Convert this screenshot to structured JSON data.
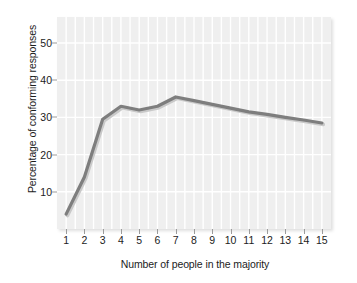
{
  "chart_data": {
    "type": "line",
    "title": "",
    "xlabel": "Number of people in the majority",
    "ylabel": "Percentage of conforming responses",
    "x": [
      1,
      2,
      3,
      4,
      5,
      6,
      7,
      8,
      9,
      10,
      11,
      12,
      13,
      14,
      15
    ],
    "values": [
      4,
      14,
      29.5,
      33,
      32,
      33,
      35.5,
      34.5,
      33.5,
      32.5,
      31.5,
      30.8,
      30,
      29.3,
      28.5
    ],
    "series": [
      {
        "name": "Conforming responses",
        "values": [
          4,
          14,
          29.5,
          33,
          32,
          33,
          35.5,
          34.5,
          33.5,
          32.5,
          31.5,
          30.8,
          30,
          29.3,
          28.5
        ]
      }
    ],
    "xtick_labels": [
      "1",
      "2",
      "3",
      "4",
      "5",
      "6",
      "7",
      "8",
      "9",
      "10",
      "11",
      "12",
      "13",
      "14",
      "15"
    ],
    "ytick_labels": [
      "10",
      "20",
      "30",
      "40",
      "50"
    ],
    "ytick_values": [
      10,
      20,
      30,
      40,
      50
    ],
    "xlim": [
      0.5,
      15.5
    ],
    "ylim": [
      0,
      57
    ],
    "grid": true,
    "legend": "none",
    "line_color": "#7e7e7e",
    "plot_background": "#efefef",
    "gridline_color": "#ffffff",
    "text_color": "#1c1c1c"
  }
}
